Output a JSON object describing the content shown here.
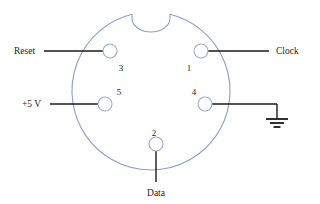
{
  "diagram": {
    "type": "connector-pinout",
    "colors": {
      "connector_outline": "#8c9ec6",
      "pin_outline": "#9aa9cd",
      "lead_line": "#1a1a1a",
      "text": "#1a1a1a",
      "background": "#ffffff"
    },
    "connector": {
      "shell_center_x": 151,
      "shell_center_y": 91,
      "shell_radius": 79,
      "notch": {
        "label": "keyway-notch",
        "position": "top",
        "width": 38,
        "depth": 22
      }
    },
    "pins": [
      {
        "number": "3",
        "signal": "Reset",
        "cx": 110,
        "cy": 51,
        "r": 7,
        "number_x": 121,
        "number_y": 71,
        "lead": {
          "side": "left",
          "x1": 44,
          "y1": 51,
          "x2": 103,
          "y2": 51
        },
        "label_x": 14,
        "label_y": 54,
        "label_anchor": "start"
      },
      {
        "number": "1",
        "signal": "Clock",
        "cx": 201,
        "cy": 51,
        "r": 7,
        "number_x": 189,
        "number_y": 71,
        "lead": {
          "side": "right",
          "x1": 208,
          "y1": 51,
          "x2": 269,
          "y2": 51
        },
        "label_x": 276,
        "label_y": 54,
        "label_anchor": "start"
      },
      {
        "number": "5",
        "signal": "+5 V",
        "cx": 105,
        "cy": 104,
        "r": 7,
        "number_x": 119,
        "number_y": 95,
        "lead": {
          "side": "left",
          "x1": 50,
          "y1": 104,
          "x2": 98,
          "y2": 104
        },
        "label_x": 22,
        "label_y": 107,
        "label_anchor": "start"
      },
      {
        "number": "4",
        "signal": "ground",
        "cx": 205,
        "cy": 104,
        "r": 7,
        "number_x": 194,
        "number_y": 95,
        "lead": {
          "side": "right",
          "x1": 212,
          "y1": 104,
          "x2": 277,
          "y2": 104
        },
        "label_x": null,
        "label_y": null,
        "label_anchor": "middle"
      },
      {
        "number": "2",
        "signal": "Data",
        "cx": 156,
        "cy": 144,
        "r": 7,
        "number_x": 154,
        "number_y": 136,
        "lead": {
          "side": "bottom",
          "x1": 156,
          "y1": 151,
          "x2": 156,
          "y2": 182
        },
        "label_x": 156,
        "label_y": 196,
        "label_anchor": "middle"
      }
    ],
    "ground_symbol": {
      "name": "earth-ground-symbol",
      "stem_x": 277,
      "stem_y1": 104,
      "stem_y2": 119,
      "bars": [
        {
          "half_width": 11,
          "y": 119
        },
        {
          "half_width": 7,
          "y": 123
        },
        {
          "half_width": 3.5,
          "y": 127
        }
      ]
    }
  }
}
